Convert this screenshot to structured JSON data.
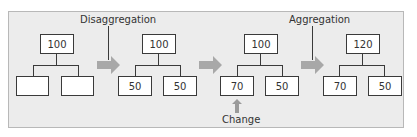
{
  "diagram": {
    "title": "",
    "labels": {
      "disaggregation": "Disaggregation",
      "aggregation": "Aggregation",
      "change": "Change"
    },
    "stages": [
      {
        "parent": "100",
        "children": [
          "",
          ""
        ]
      },
      {
        "parent": "100",
        "children": [
          "50",
          "50"
        ]
      },
      {
        "parent": "100",
        "children": [
          "70",
          "50"
        ]
      },
      {
        "parent": "120",
        "children": [
          "70",
          "50"
        ]
      }
    ],
    "colors": {
      "panel": "#ececec",
      "arrow": "#a8a8a8",
      "box_border": "#3a3a3a"
    }
  }
}
